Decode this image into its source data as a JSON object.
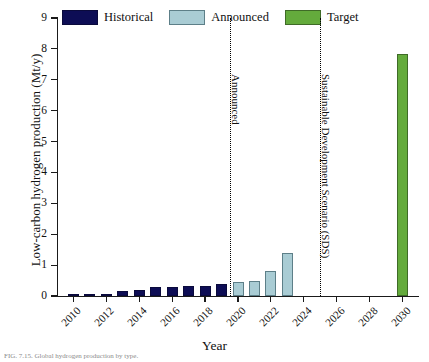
{
  "chart_data": {
    "type": "bar",
    "title": "",
    "xlabel": "Year",
    "ylabel": "Low-carbon hydrogen production (Mt/y)",
    "xlim": [
      2009,
      2031
    ],
    "ylim": [
      0,
      9
    ],
    "ytick_labels": [
      "0",
      "1",
      "2",
      "3",
      "4",
      "5",
      "6",
      "7",
      "8",
      "9"
    ],
    "ytick_values": [
      0,
      1,
      2,
      3,
      4,
      5,
      6,
      7,
      8,
      9
    ],
    "xtick_labels": [
      "2010",
      "2012",
      "2014",
      "2016",
      "2018",
      "2020",
      "2022",
      "2024",
      "2026",
      "2028",
      "2030"
    ],
    "xtick_values": [
      2010,
      2012,
      2014,
      2016,
      2018,
      2020,
      2022,
      2024,
      2026,
      2028,
      2030
    ],
    "grid": false,
    "legend_position": "top-left",
    "series": [
      {
        "name": "Historical",
        "color": "#0d0d55",
        "x": [
          2010,
          2011,
          2012,
          2013,
          2014,
          2015,
          2016,
          2017,
          2018,
          2019
        ],
        "values": [
          0.03,
          0.03,
          0.04,
          0.17,
          0.2,
          0.28,
          0.3,
          0.31,
          0.34,
          0.38
        ]
      },
      {
        "name": "Announced",
        "color": "#a9ccd4",
        "x": [
          2020,
          2021,
          2022,
          2023
        ],
        "values": [
          0.45,
          0.5,
          0.82,
          1.4
        ]
      },
      {
        "name": "Target",
        "color": "#64ab3c",
        "x": [
          2030
        ],
        "values": [
          7.85
        ]
      }
    ],
    "annotations": [
      {
        "text": "Announced",
        "x": 2019.5,
        "orientation": "vertical"
      },
      {
        "text": "Sustainable Development Scenario (SDS)",
        "x": 2025.0,
        "orientation": "vertical"
      }
    ]
  },
  "legend": {
    "entries": [
      {
        "label": "Historical",
        "color": "#0d0d55"
      },
      {
        "label": "Announced",
        "color": "#a9ccd4"
      },
      {
        "label": "Target",
        "color": "#64ab3c"
      }
    ]
  },
  "caption": "FIG. 7.15.   Global hydrogen production by type."
}
